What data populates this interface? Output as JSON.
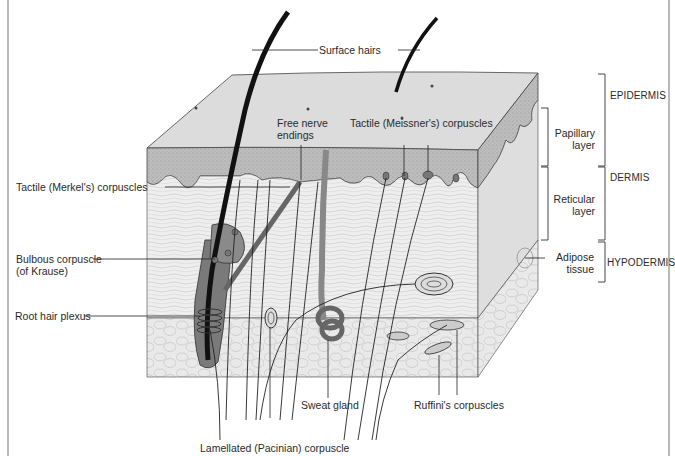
{
  "figure": {
    "title_clipped": "",
    "left_labels": {
      "merkel": "Tactile (Merkel's) corpuscles",
      "krause_line1": "Bulbous corpuscle",
      "krause_line2": "(of Krause)",
      "root_hair_plexus": "Root hair plexus"
    },
    "top_labels": {
      "surface_hairs": "Surface hairs",
      "free_nerve_line1": "Free nerve",
      "free_nerve_line2": "endings",
      "meissner": "Tactile (Meissner's) corpuscles"
    },
    "bottom_labels": {
      "sweat_gland": "Sweat gland",
      "ruffini": "Ruffini's corpuscles",
      "pacinian": "Lamellated (Pacinian) corpuscle"
    },
    "right_labels": {
      "papillary_line1": "Papillary",
      "papillary_line2": "layer",
      "reticular_line1": "Reticular",
      "reticular_line2": "layer",
      "adipose_line1": "Adipose",
      "adipose_line2": "tissue"
    },
    "layers": {
      "epidermis": "EPIDERMIS",
      "dermis": "DERMIS",
      "hypodermis": "HYPODERMIS"
    },
    "colors": {
      "epidermis_fill": "#bdbdbd",
      "top_surface": "#dcdcdc",
      "dermis_fill": "#ececec",
      "hypodermis_fill": "#e6e6e6",
      "follicle_fill": "#7a7a7a",
      "hair": "#111111",
      "line": "#333333",
      "border": "#8a8a8a"
    }
  }
}
